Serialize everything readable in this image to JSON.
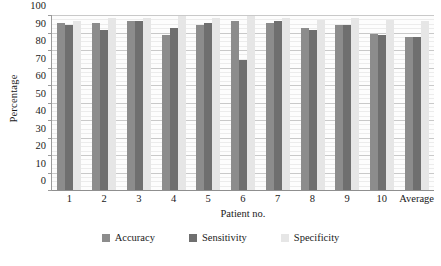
{
  "chart_data": {
    "type": "bar",
    "title": "",
    "xlabel": "Patient no.",
    "ylabel": "Percentage",
    "categories": [
      "1",
      "2",
      "3",
      "4",
      "5",
      "6",
      "7",
      "8",
      "9",
      "10",
      "Average"
    ],
    "series": [
      {
        "name": "Accuracy",
        "color": "#8c8c8c",
        "values": [
          96,
          96,
          97,
          89,
          95,
          97,
          96,
          93,
          95,
          90,
          88
        ]
      },
      {
        "name": "Sensitivity",
        "color": "#6f6f6f",
        "values": [
          95,
          92,
          97,
          93,
          96,
          75,
          97,
          92,
          95,
          89,
          88
        ]
      },
      {
        "name": "Specificity",
        "color": "#e6e6e6",
        "values": [
          97,
          99,
          99,
          100,
          99,
          100,
          99,
          98,
          99,
          98,
          97
        ]
      }
    ],
    "ylim": [
      0,
      100
    ],
    "yticks": [
      0,
      10,
      20,
      30,
      40,
      50,
      60,
      70,
      80,
      90,
      100
    ],
    "ytick_labels": [
      "0",
      "10",
      "20",
      "30",
      "40",
      "50",
      "60",
      "70",
      "80",
      "90",
      "100"
    ],
    "grid": true,
    "minor_grid": true,
    "legend_position": "bottom"
  }
}
